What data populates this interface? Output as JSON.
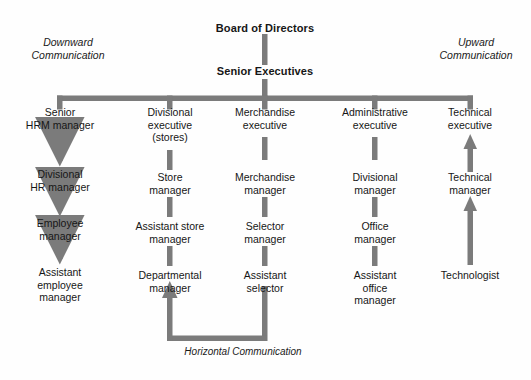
{
  "diagram": {
    "title_top": "Board of Directors",
    "title_second": "Senior Executives",
    "accent_color": "#7b7b7b",
    "background_color": "#fefefe",
    "text_color": "#161616",
    "side_labels": {
      "left": "Downward\nCommunication",
      "right": "Upward\nCommunication"
    },
    "bottom_label": "Horizontal Communication",
    "columns": [
      {
        "key": "hrm",
        "flow": "downward",
        "nodes": [
          "Senior\nHRM manager",
          "Divisional\nHR manager",
          "Employee\nmanager",
          "Assistant\nemployee\nmanager"
        ]
      },
      {
        "key": "stores",
        "flow": "plain",
        "nodes": [
          "Divisional\nexecutive\n(stores)",
          "Store\nmanager",
          "Assistant store\nmanager",
          "Departmental\nmanager"
        ]
      },
      {
        "key": "merchandise",
        "flow": "plain",
        "nodes": [
          "Merchandise\nexecutive",
          "Merchandise\nmanager",
          "Selector\nmanager",
          "Assistant\nselector"
        ]
      },
      {
        "key": "administrative",
        "flow": "plain",
        "nodes": [
          "Administrative\nexecutive",
          "Divisional\nmanager",
          "Office\nmanager",
          "Assistant\noffice\nmanager"
        ]
      },
      {
        "key": "technical",
        "flow": "upward",
        "nodes": [
          "Technical\nexecutive",
          "Technical\nmanager",
          "Technologist"
        ]
      }
    ]
  }
}
